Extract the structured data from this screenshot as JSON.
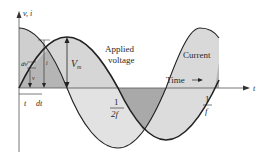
{
  "diagram": {
    "axes": {
      "y_label": "v, i",
      "x_label": "t"
    },
    "labels": {
      "applied_voltage_line1": "Applied",
      "applied_voltage_line2": "voltage",
      "current": "Current",
      "time": "Time",
      "amplitude": "V",
      "amplitude_sub": "m",
      "half_period_num": "1",
      "half_period_den": "2f",
      "period_num": "1",
      "period_den": "f",
      "t_label": "t",
      "dt_label": "dt",
      "dv_label": "dv",
      "v_label": "v",
      "i_label": "i"
    },
    "colors": {
      "fill_light": "#d9d9d9",
      "fill_dark": "#b8b8b8",
      "curve": "#222222",
      "axis": "#555555"
    }
  }
}
